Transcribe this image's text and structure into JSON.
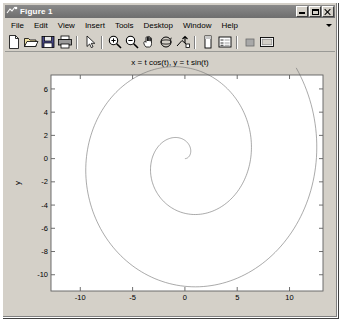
{
  "window": {
    "title": "Figure 1",
    "app_icon": "matlab-figure-icon",
    "controls": [
      {
        "name": "minimize-button",
        "glyph": "minimize"
      },
      {
        "name": "maximize-button",
        "glyph": "maximize"
      },
      {
        "name": "close-button",
        "glyph": "close"
      }
    ]
  },
  "menubar": {
    "items": [
      {
        "label": "File"
      },
      {
        "label": "Edit"
      },
      {
        "label": "View"
      },
      {
        "label": "Insert"
      },
      {
        "label": "Tools"
      },
      {
        "label": "Desktop"
      },
      {
        "label": "Window"
      },
      {
        "label": "Help"
      }
    ],
    "overflow_icon": "chevron-down-icon"
  },
  "toolbar": {
    "buttons": [
      {
        "name": "new-figure-icon",
        "tooltip": "New Figure"
      },
      {
        "name": "open-file-icon",
        "tooltip": "Open File"
      },
      {
        "name": "save-figure-icon",
        "tooltip": "Save Figure"
      },
      {
        "name": "print-figure-icon",
        "tooltip": "Print Figure"
      },
      {
        "name": "edit-plot-arrow-icon",
        "tooltip": "Edit Plot"
      },
      {
        "name": "zoom-in-icon",
        "tooltip": "Zoom In"
      },
      {
        "name": "zoom-out-icon",
        "tooltip": "Zoom Out"
      },
      {
        "name": "pan-hand-icon",
        "tooltip": "Pan"
      },
      {
        "name": "rotate-3d-icon",
        "tooltip": "Rotate 3D"
      },
      {
        "name": "data-cursor-icon",
        "tooltip": "Data Cursor"
      },
      {
        "name": "insert-colorbar-icon",
        "tooltip": "Insert Colorbar"
      },
      {
        "name": "insert-legend-icon",
        "tooltip": "Insert Legend"
      },
      {
        "name": "hide-plot-tools-icon",
        "tooltip": "Hide Plot Tools"
      },
      {
        "name": "show-plot-tools-icon",
        "tooltip": "Show Plot Tools"
      }
    ]
  },
  "colors": {
    "window_face": "#d4d0c8",
    "axes_background": "#ffffff",
    "axes_line": "#606060",
    "curve": "#707070",
    "text": "#000000",
    "titlebar_start": "#8a8a8a",
    "titlebar_end": "#6e6e6e"
  },
  "chart_data": {
    "type": "line",
    "title": "x = t cos(t), y = t sin(t)",
    "xlabel": "x",
    "ylabel": "y",
    "xlim": [
      -12.8,
      13.2
    ],
    "ylim": [
      -11.4,
      7.2
    ],
    "xticks": [
      -10,
      -5,
      0,
      5,
      10
    ],
    "yticks": [
      6,
      4,
      2,
      0,
      -2,
      -4,
      -6,
      -8,
      -10
    ],
    "grid": false,
    "legend": null,
    "parametric": {
      "x_expression": "t*cos(t)",
      "y_expression": "t*sin(t)",
      "t_start": 0,
      "t_end": 13.2,
      "samples": 400
    },
    "series": [
      {
        "name": "spiral",
        "color": "#707070",
        "linewidth": 0.6,
        "points_t": [
          0,
          0.66,
          1.32,
          1.98,
          2.64,
          3.3,
          3.96,
          4.62,
          5.28,
          5.94,
          6.6,
          7.26,
          7.92,
          8.58,
          9.24,
          9.9,
          10.56,
          11.22,
          11.88,
          12.54,
          13.2
        ]
      }
    ]
  }
}
